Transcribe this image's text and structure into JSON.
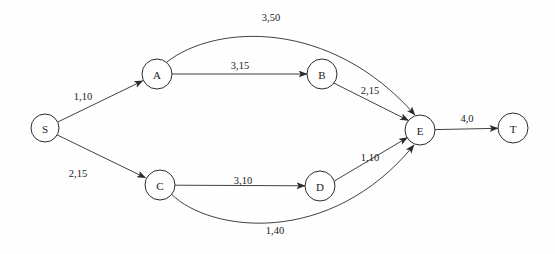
{
  "diagram": {
    "title": "",
    "type": "directed-network-flow-graph",
    "colors": {
      "background": "#fefefe",
      "stroke": "#2b2b2b",
      "node_fill": "#ffffff",
      "text": "#1a1a1a"
    },
    "nodes": [
      {
        "id": "S",
        "label": "S",
        "cx": 45,
        "cy": 128,
        "r": 14
      },
      {
        "id": "A",
        "label": "A",
        "cx": 157,
        "cy": 74,
        "r": 15
      },
      {
        "id": "B",
        "label": "B",
        "cx": 322,
        "cy": 74,
        "r": 15
      },
      {
        "id": "C",
        "label": "C",
        "cx": 160,
        "cy": 185,
        "r": 15
      },
      {
        "id": "D",
        "label": "D",
        "cx": 320,
        "cy": 186,
        "r": 15
      },
      {
        "id": "E",
        "label": "E",
        "cx": 420,
        "cy": 130,
        "r": 15
      },
      {
        "id": "T",
        "label": "T",
        "cx": 513,
        "cy": 128,
        "r": 15
      }
    ],
    "edges": [
      {
        "id": "S-A",
        "from": "S",
        "to": "A",
        "label": "1,10",
        "label_x": 83,
        "label_y": 96,
        "capacity": 1,
        "cost": 10,
        "shape": "straight"
      },
      {
        "id": "S-C",
        "from": "S",
        "to": "C",
        "label": "2,15",
        "label_x": 78,
        "label_y": 173,
        "capacity": 2,
        "cost": 15,
        "shape": "straight"
      },
      {
        "id": "A-B",
        "from": "A",
        "to": "B",
        "label": "3,15",
        "label_x": 240,
        "label_y": 65,
        "capacity": 3,
        "cost": 15,
        "shape": "straight"
      },
      {
        "id": "A-E",
        "from": "A",
        "to": "E",
        "label": "3,50",
        "label_x": 271,
        "label_y": 17,
        "capacity": 3,
        "cost": 50,
        "shape": "arc-up"
      },
      {
        "id": "B-E",
        "from": "B",
        "to": "E",
        "label": "2,15",
        "label_x": 370,
        "label_y": 90,
        "capacity": 2,
        "cost": 15,
        "shape": "straight"
      },
      {
        "id": "C-D",
        "from": "C",
        "to": "D",
        "label": "3,10",
        "label_x": 243,
        "label_y": 180,
        "capacity": 3,
        "cost": 10,
        "shape": "straight"
      },
      {
        "id": "C-E",
        "from": "C",
        "to": "E",
        "label": "1,40",
        "label_x": 275,
        "label_y": 230,
        "capacity": 1,
        "cost": 40,
        "shape": "arc-down"
      },
      {
        "id": "D-E",
        "from": "D",
        "to": "E",
        "label": "1,10",
        "label_x": 370,
        "label_y": 157,
        "capacity": 1,
        "cost": 10,
        "shape": "straight"
      },
      {
        "id": "E-T",
        "from": "E",
        "to": "T",
        "label": "4,0",
        "label_x": 467,
        "label_y": 118,
        "capacity": 4,
        "cost": 0,
        "shape": "straight"
      }
    ]
  }
}
